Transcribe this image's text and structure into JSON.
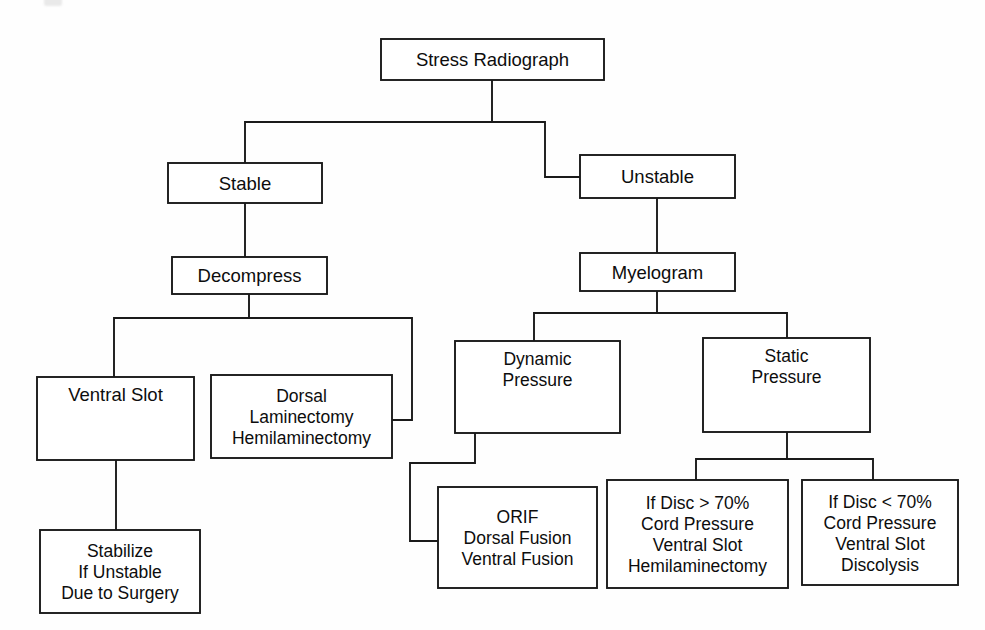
{
  "diagram": {
    "stroke_color": "#1a1a1a",
    "box_fill": "#ffffff",
    "canvas": {
      "width": 985,
      "height": 630
    },
    "nodes": [
      {
        "id": "stress_radiograph",
        "name": "stress-radiograph",
        "lines": [
          "Stress Radiograph"
        ],
        "x": 381,
        "y": 39,
        "w": 223,
        "h": 41,
        "align": "middle"
      },
      {
        "id": "stable",
        "name": "stable",
        "lines": [
          "Stable"
        ],
        "x": 168,
        "y": 163,
        "w": 154,
        "h": 40,
        "align": "middle"
      },
      {
        "id": "unstable",
        "name": "unstable",
        "lines": [
          "Unstable"
        ],
        "x": 580,
        "y": 155,
        "w": 155,
        "h": 43,
        "align": "middle"
      },
      {
        "id": "decompress",
        "name": "decompress",
        "lines": [
          "Decompress"
        ],
        "x": 172,
        "y": 257,
        "w": 155,
        "h": 37,
        "align": "middle"
      },
      {
        "id": "myelogram",
        "name": "myelogram",
        "lines": [
          "Myelogram"
        ],
        "x": 580,
        "y": 253,
        "w": 155,
        "h": 38,
        "align": "middle"
      },
      {
        "id": "ventral_slot",
        "name": "ventral-slot",
        "lines": [
          "Ventral Slot"
        ],
        "x": 37,
        "y": 377,
        "w": 157,
        "h": 83,
        "align": "top"
      },
      {
        "id": "dorsal_laminectomy",
        "name": "dorsal-laminectomy",
        "lines": [
          "Dorsal",
          "Laminectomy",
          "Hemilaminectomy"
        ],
        "x": 211,
        "y": 375,
        "w": 181,
        "h": 83,
        "align": "middle"
      },
      {
        "id": "dynamic_pressure",
        "name": "dynamic-pressure",
        "lines": [
          "Dynamic",
          "Pressure"
        ],
        "x": 455,
        "y": 341,
        "w": 165,
        "h": 92,
        "align": "top"
      },
      {
        "id": "static_pressure",
        "name": "static-pressure",
        "lines": [
          "Static",
          "Pressure"
        ],
        "x": 703,
        "y": 338,
        "w": 167,
        "h": 94,
        "align": "top"
      },
      {
        "id": "stabilize",
        "name": "stabilize-if-unstable",
        "lines": [
          "Stabilize",
          "If Unstable",
          "Due to Surgery"
        ],
        "x": 40,
        "y": 530,
        "w": 160,
        "h": 83,
        "align": "middle"
      },
      {
        "id": "orif",
        "name": "orif-fusion",
        "lines": [
          "ORIF",
          "Dorsal Fusion",
          "Ventral Fusion"
        ],
        "x": 438,
        "y": 487,
        "w": 159,
        "h": 101,
        "align": "middle"
      },
      {
        "id": "disc_greater",
        "name": "disc-greater-70",
        "lines": [
          "If Disc > 70%",
          "Cord Pressure",
          "Ventral Slot",
          "Hemilaminectomy"
        ],
        "x": 607,
        "y": 480,
        "w": 181,
        "h": 108,
        "align": "middle"
      },
      {
        "id": "disc_less",
        "name": "disc-less-70",
        "lines": [
          "If Disc < 70%",
          "Cord Pressure",
          "Ventral Slot",
          "Discolysis"
        ],
        "x": 802,
        "y": 480,
        "w": 156,
        "h": 105,
        "align": "middle"
      }
    ],
    "edges": [
      {
        "id": "e_root_split",
        "name": "edge-stress-radiograph-split",
        "from": "stress_radiograph",
        "to": "branch",
        "points": "492,80 492,122 245,122 245,163"
      },
      {
        "id": "e_root_unstable",
        "name": "edge-stress-radiograph-unstable",
        "from": "stress_radiograph",
        "to": "unstable",
        "points": "492,122 545,122 545,177 580,177"
      },
      {
        "id": "e_stable_decompress",
        "name": "edge-stable-decompress",
        "from": "stable",
        "to": "decompress",
        "points": "245,203 245,257"
      },
      {
        "id": "e_unstable_myelogram",
        "name": "edge-unstable-myelogram",
        "from": "unstable",
        "to": "myelogram",
        "points": "657,198 657,253"
      },
      {
        "id": "e_decompress_ventral",
        "name": "edge-decompress-ventral-slot",
        "from": "decompress",
        "to": "ventral_slot",
        "points": "249,294 249,318 114,318 114,377"
      },
      {
        "id": "e_decompress_dorsal",
        "name": "edge-decompress-dorsal",
        "from": "decompress",
        "to": "dorsal_laminectomy",
        "points": "249,318 412,318 412,420 392,420"
      },
      {
        "id": "e_myelogram_dynamic",
        "name": "edge-myelogram-dynamic-pressure",
        "from": "myelogram",
        "to": "dynamic_pressure",
        "points": "657,291 657,313 534,313 534,341"
      },
      {
        "id": "e_myelogram_static",
        "name": "edge-myelogram-static-pressure",
        "from": "myelogram",
        "to": "static_pressure",
        "points": "657,313 787,313 787,338"
      },
      {
        "id": "e_ventral_stabilize",
        "name": "edge-ventral-slot-stabilize",
        "from": "ventral_slot",
        "to": "stabilize",
        "points": "116,460 116,530"
      },
      {
        "id": "e_dynamic_orif",
        "name": "edge-dynamic-pressure-orif",
        "from": "dynamic_pressure",
        "to": "orif",
        "points": "475,433 475,463 410,463 410,541 438,541"
      },
      {
        "id": "e_static_greater",
        "name": "edge-static-pressure-disc-greater",
        "from": "static_pressure",
        "to": "disc_greater",
        "points": "787,432 787,459 696,459 696,480"
      },
      {
        "id": "e_static_less",
        "name": "edge-static-pressure-disc-less",
        "from": "static_pressure",
        "to": "disc_less",
        "points": "787,459 873,459 873,480"
      }
    ]
  }
}
